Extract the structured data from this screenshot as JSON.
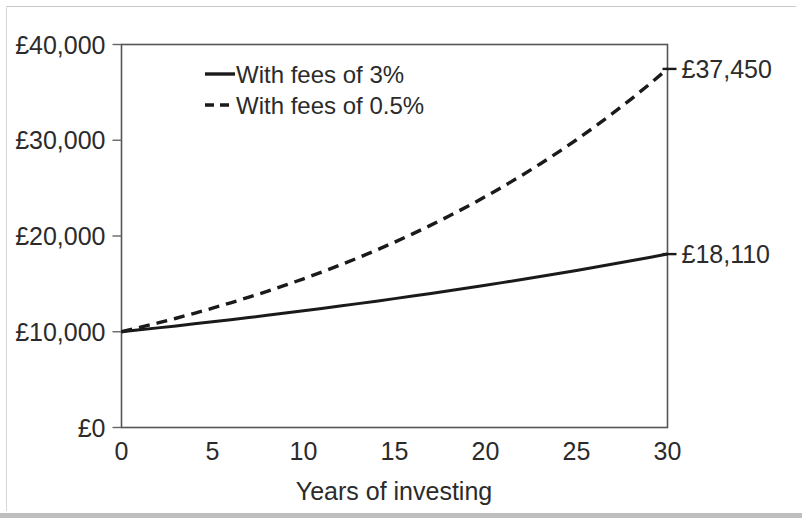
{
  "chart_data": {
    "type": "line",
    "title": "",
    "xlabel": "Years of investing",
    "ylabel": "",
    "x": [
      0,
      1,
      2,
      3,
      4,
      5,
      6,
      7,
      8,
      9,
      10,
      11,
      12,
      13,
      14,
      15,
      16,
      17,
      18,
      19,
      20,
      21,
      22,
      23,
      24,
      25,
      26,
      27,
      28,
      29,
      30
    ],
    "xlim": [
      0,
      30
    ],
    "ylim": [
      0,
      40000
    ],
    "grid": false,
    "legend_position": "top-left-inside",
    "xticks": [
      0,
      5,
      10,
      15,
      20,
      25,
      30
    ],
    "xtick_labels": [
      "0",
      "5",
      "10",
      "15",
      "20",
      "25",
      "30"
    ],
    "yticks": [
      0,
      10000,
      20000,
      30000,
      40000
    ],
    "ytick_labels": [
      "£0",
      "£10,000",
      "£20,000",
      "£30,000",
      "£40,000"
    ],
    "series": [
      {
        "name": "With fees of 3%",
        "style": "solid",
        "color": "#1a1a1a",
        "end_label": "£18,110",
        "values": [
          10000,
          10200,
          10404,
          10612,
          10824,
          11041,
          11262,
          11487,
          11717,
          11951,
          12190,
          12434,
          12682,
          12936,
          13195,
          13459,
          13728,
          14002,
          14282,
          14568,
          14859,
          15157,
          15460,
          15769,
          16084,
          16406,
          16734,
          17069,
          17410,
          17758,
          18110
        ]
      },
      {
        "name": "With fees of 0.5%",
        "style": "dashed",
        "color": "#1a1a1a",
        "end_label": "£37,450",
        "values": [
          10000,
          10450,
          10920,
          11412,
          11925,
          12462,
          13023,
          13609,
          14221,
          14861,
          15530,
          16229,
          16959,
          17722,
          18520,
          19353,
          20224,
          21134,
          22085,
          23079,
          24117,
          25202,
          26336,
          27521,
          28760,
          30054,
          31407,
          32821,
          34298,
          35842,
          37450
        ]
      }
    ],
    "annotations": [
      {
        "name": "end-value-high",
        "text": "£37,450",
        "x": 30,
        "y": 37450
      },
      {
        "name": "end-value-low",
        "text": "£18,110",
        "x": 30,
        "y": 18110
      }
    ]
  },
  "legend": {
    "entries": [
      {
        "label": "With fees of 3%",
        "style": "solid"
      },
      {
        "label": "With fees of 0.5%",
        "style": "dashed"
      }
    ]
  },
  "colors": {
    "line": "#1a1a1a",
    "axis": "#555555",
    "text": "#2b2b2b",
    "background": "#ffffff"
  }
}
